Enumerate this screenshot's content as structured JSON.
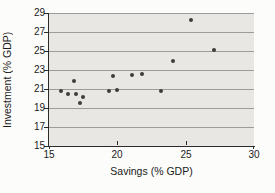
{
  "figure": {
    "background": "#fcfcfa",
    "text_color": "#1b1b1b"
  },
  "chart_data": {
    "type": "scatter",
    "title": "",
    "xlabel": "Savings (% GDP)",
    "ylabel": "Investment (% GDP)",
    "xlim": [
      15,
      30
    ],
    "ylim": [
      15,
      29
    ],
    "xticks": [
      15,
      20,
      25,
      30
    ],
    "yticks": [
      15,
      17,
      19,
      21,
      23,
      25,
      27,
      29
    ],
    "grid": "horizontal-only",
    "legend": "none",
    "colors": {
      "plot_bg": "#e8e7e3",
      "gridline": "#9c9c99",
      "axis": "#2b2b2b",
      "point": "#3c3c3c"
    },
    "points": [
      {
        "x": 15.9,
        "y": 20.8
      },
      {
        "x": 16.4,
        "y": 20.5
      },
      {
        "x": 16.8,
        "y": 21.8
      },
      {
        "x": 17.0,
        "y": 20.5
      },
      {
        "x": 17.3,
        "y": 19.5
      },
      {
        "x": 17.5,
        "y": 20.2
      },
      {
        "x": 19.4,
        "y": 20.8
      },
      {
        "x": 19.7,
        "y": 22.4
      },
      {
        "x": 20.0,
        "y": 20.9
      },
      {
        "x": 21.1,
        "y": 22.5
      },
      {
        "x": 21.8,
        "y": 22.6
      },
      {
        "x": 23.2,
        "y": 20.8
      },
      {
        "x": 24.1,
        "y": 23.9
      },
      {
        "x": 25.4,
        "y": 28.3
      },
      {
        "x": 27.1,
        "y": 25.1
      }
    ]
  }
}
